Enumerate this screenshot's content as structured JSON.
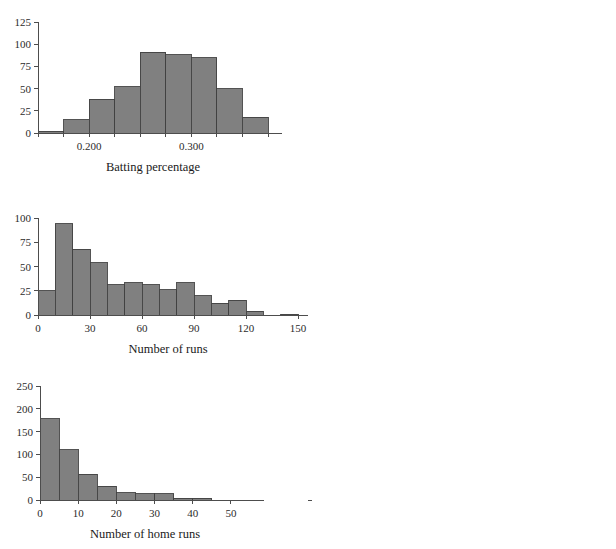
{
  "figure": {
    "background": "#ffffff",
    "bar_fill": "#808080",
    "bar_stroke": "#404040",
    "axis_color": "#4d4d4d",
    "text_color": "#1a1a1a",
    "layout": "2 columns x 3 rows of histograms"
  },
  "chart_data": [
    {
      "type": "bar",
      "id": "batting-percentage",
      "title": "",
      "xlabel": "Batting percentage",
      "ylabel": "",
      "grid": false,
      "legend": "none",
      "xlim": [
        0.15,
        0.375
      ],
      "ylim": [
        0,
        125
      ],
      "xticks": [
        0.2,
        0.3
      ],
      "xtick_labels": [
        "0.200",
        "0.300"
      ],
      "xminor_ticks": [
        0.15,
        0.175,
        0.225,
        0.25,
        0.275,
        0.325,
        0.35,
        0.375
      ],
      "yticks": [
        0,
        25,
        50,
        75,
        100,
        125
      ],
      "ytick_labels": [
        "0",
        "25",
        "50",
        "75",
        "100",
        "125"
      ],
      "bin_width": 0.025,
      "bin_edges": [
        0.15,
        0.175,
        0.2,
        0.225,
        0.25,
        0.275,
        0.3,
        0.325,
        0.35,
        0.375
      ],
      "categories": [
        "0.150-0.175",
        "0.175-0.200",
        "0.200-0.225",
        "0.225-0.250",
        "0.250-0.275",
        "0.275-0.300",
        "0.300-0.325",
        "0.325-0.350",
        "0.350-0.375"
      ],
      "values": [
        2,
        15,
        38,
        52,
        91,
        88,
        85,
        50,
        18,
        9
      ]
    },
    {
      "type": "bar",
      "id": "times-at-bat",
      "title": "",
      "xlabel": "Times at bat",
      "ylabel": "",
      "grid": false,
      "legend": "none",
      "xlim": [
        0,
        700
      ],
      "ylim": [
        0,
        100
      ],
      "xticks": [
        0,
        100,
        200,
        300,
        400,
        500,
        600,
        700
      ],
      "xtick_labels": [
        "0",
        "100",
        "200",
        "300",
        "400",
        "500",
        "600",
        "700"
      ],
      "yticks": [
        0,
        25,
        50,
        75,
        100
      ],
      "ytick_labels": [
        "0",
        "25",
        "50",
        "75",
        "100"
      ],
      "bin_width": 50,
      "bin_edges": [
        0,
        50,
        100,
        150,
        200,
        250,
        300,
        350,
        400,
        450,
        500,
        550,
        600,
        650,
        700
      ],
      "categories": [
        "0-50",
        "50-100",
        "100-150",
        "150-200",
        "200-250",
        "250-300",
        "300-350",
        "350-400",
        "400-450",
        "450-500",
        "500-550",
        "550-600",
        "600-650",
        "650-700"
      ],
      "values": [
        2,
        40,
        73,
        44,
        40,
        30,
        30,
        20,
        36,
        25,
        49,
        33,
        19,
        5
      ]
    },
    {
      "type": "bar",
      "id": "number-of-runs",
      "title": "",
      "xlabel": "Number of runs",
      "ylabel": "",
      "grid": false,
      "legend": "none",
      "xlim": [
        0,
        150
      ],
      "ylim": [
        0,
        100
      ],
      "xticks": [
        0,
        30,
        60,
        90,
        120,
        150
      ],
      "xtick_labels": [
        "0",
        "30",
        "60",
        "90",
        "120",
        "150"
      ],
      "yticks": [
        0,
        25,
        50,
        75,
        100
      ],
      "ytick_labels": [
        "0",
        "25",
        "50",
        "75",
        "100"
      ],
      "bin_width": 10,
      "bin_edges": [
        0,
        10,
        20,
        30,
        40,
        50,
        60,
        70,
        80,
        90,
        100,
        110,
        120,
        130,
        140,
        150
      ],
      "categories": [
        "0-10",
        "10-20",
        "20-30",
        "30-40",
        "40-50",
        "50-60",
        "60-70",
        "70-80",
        "80-90",
        "90-100",
        "100-110",
        "110-120",
        "120-130",
        "130-140",
        "140-150"
      ],
      "values": [
        25,
        94,
        68,
        54,
        31,
        33,
        31,
        26,
        33,
        20,
        12,
        15,
        4,
        0,
        1
      ]
    },
    {
      "type": "bar",
      "id": "number-of-hits",
      "title": "",
      "xlabel": "Number of hits",
      "ylabel": "",
      "grid": false,
      "legend": "none",
      "xlim": [
        0,
        225
      ],
      "ylim": [
        0,
        125
      ],
      "xticks": [
        0,
        100,
        200
      ],
      "xtick_labels": [
        "0",
        "100",
        "200"
      ],
      "yticks": [
        0,
        25,
        50,
        75,
        100,
        125
      ],
      "ytick_labels": [
        "0",
        "25",
        "50",
        "75",
        "100",
        "125"
      ],
      "bin_width": 25,
      "bin_edges": [
        0,
        25,
        50,
        75,
        100,
        125,
        150,
        175,
        200,
        225
      ],
      "categories": [
        "0-25",
        "25-50",
        "50-75",
        "75-100",
        "100-125",
        "125-150",
        "150-175",
        "175-200",
        "200-225"
      ],
      "values": [
        27,
        95,
        64,
        50,
        33,
        36,
        46,
        41,
        28,
        20,
        3
      ]
    },
    {
      "type": "bar",
      "id": "number-of-home-runs",
      "title": "",
      "xlabel": "Number of home runs",
      "ylabel": "",
      "grid": false,
      "legend": "none",
      "xlim": [
        0,
        55
      ],
      "ylim": [
        0,
        250
      ],
      "xticks": [
        0,
        10,
        20,
        30,
        40,
        50
      ],
      "xtick_labels": [
        "0",
        "10",
        "20",
        "30",
        "40",
        "50"
      ],
      "yticks": [
        0,
        50,
        100,
        150,
        200,
        250
      ],
      "ytick_labels": [
        "0",
        "50",
        "100",
        "150",
        "200",
        "250"
      ],
      "bin_width": 5,
      "bin_edges": [
        0,
        5,
        10,
        15,
        20,
        25,
        30,
        35,
        40,
        45,
        50,
        55
      ],
      "categories": [
        "0-5",
        "5-10",
        "10-15",
        "15-20",
        "20-25",
        "25-30",
        "30-35",
        "35-40",
        "40-45",
        "45-50",
        "50-55"
      ],
      "values": [
        178,
        110,
        57,
        30,
        16,
        14,
        14,
        4,
        4,
        0,
        0
      ]
    },
    {
      "type": "bar",
      "id": "runs-batted-in",
      "title": "",
      "xlabel": "Runs batted in",
      "ylabel": "",
      "grid": false,
      "legend": "none",
      "xlim": [
        0,
        150
      ],
      "ylim": [
        0,
        125
      ],
      "xticks": [
        0,
        10,
        30,
        50,
        70,
        90,
        110,
        130,
        150
      ],
      "xtick_labels": [
        "0",
        "10",
        "30",
        "50",
        "70",
        "90",
        "110",
        "130",
        "150"
      ],
      "yticks": [
        0,
        25,
        50,
        75,
        100,
        125
      ],
      "ytick_labels": [
        "0",
        "25",
        "50",
        "75",
        "100",
        "125"
      ],
      "bin_width": 10,
      "bin_edges": [
        0,
        10,
        20,
        30,
        40,
        50,
        60,
        70,
        80,
        90,
        100,
        110,
        120,
        130,
        140,
        150
      ],
      "categories": [
        "0-10",
        "10-20",
        "20-30",
        "30-40",
        "40-50",
        "50-60",
        "60-70",
        "70-80",
        "80-90",
        "90-100",
        "100-110",
        "110-120",
        "120-130",
        "130-140",
        "140-150"
      ],
      "values": [
        48,
        95,
        58,
        49,
        44,
        30,
        26,
        22,
        18,
        13,
        14,
        14,
        1,
        0,
        3
      ]
    }
  ]
}
